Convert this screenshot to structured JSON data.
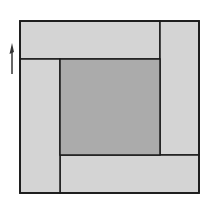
{
  "diagram": {
    "colors": {
      "outer_rect_fill": "#d4d4d4",
      "center_square_fill": "#ababab",
      "stroke": "#1a1a1a",
      "arrow": "#333333",
      "background": "#ffffff"
    },
    "shapes": {
      "outer_square": {
        "x": 20,
        "y": 21,
        "w": 179,
        "h": 172
      },
      "top_rect": {
        "x": 20,
        "y": 21,
        "w": 140,
        "h": 38
      },
      "right_rect": {
        "x": 160,
        "y": 21,
        "w": 39,
        "h": 134
      },
      "bottom_rect": {
        "x": 60,
        "y": 155,
        "w": 139,
        "h": 38
      },
      "left_rect": {
        "x": 20,
        "y": 59,
        "w": 40,
        "h": 134
      },
      "center_square": {
        "x": 60,
        "y": 59,
        "w": 100,
        "h": 96
      }
    },
    "arrow": {
      "direction": "up",
      "x": 12,
      "y_top": 43,
      "y_bottom": 74
    }
  }
}
